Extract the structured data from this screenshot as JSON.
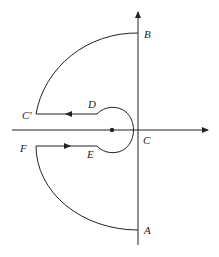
{
  "diagram": {
    "type": "contour-diagram",
    "labels": {
      "A": "A",
      "B": "B",
      "C": "C",
      "C_prime": "C′",
      "D": "D",
      "E": "E",
      "F": "F"
    },
    "colors": {
      "stroke": "#222222",
      "background": "#ffffff"
    }
  }
}
